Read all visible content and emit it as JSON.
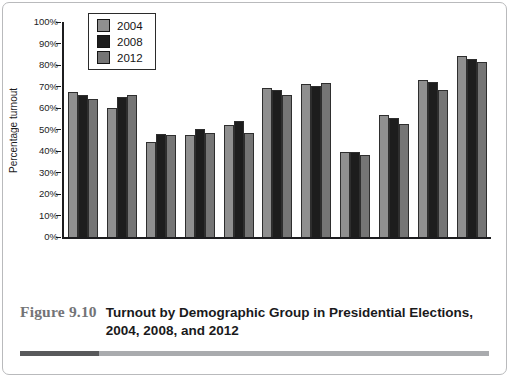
{
  "figure": {
    "label": "Figure 9.10",
    "title_line1": "Turnout by Demographic Group in Presidential Elections,",
    "title_line2": "2004, 2008, and 2012"
  },
  "chart_data": {
    "type": "bar",
    "title": "",
    "xlabel": "",
    "ylabel": "Percentage turnout",
    "ylim": [
      0,
      100
    ],
    "ytick_step": 10,
    "ytick_suffix": "%",
    "grid": false,
    "legend_position": "top-left",
    "bar_outline_color": "#2e2e2e",
    "categories": [
      "White (not Hispanic)",
      "African American",
      "Asian/Pacific",
      "Latino",
      "Under 35",
      "35–64",
      "65 and over",
      "Less than high school",
      "High school diploma",
      "College (some + BA)",
      "Postgraduate"
    ],
    "series": [
      {
        "name": "2004",
        "color": "#8f8f8f",
        "values": [
          67,
          60,
          44,
          47,
          52,
          69,
          71,
          39.5,
          56.5,
          73,
          84
        ]
      },
      {
        "name": "2008",
        "color": "#1d1d1d",
        "values": [
          66,
          65,
          47.5,
          50,
          53.5,
          68,
          70,
          39.5,
          55,
          72,
          82.5
        ]
      },
      {
        "name": "2012",
        "color": "#757575",
        "values": [
          64,
          66,
          47,
          48,
          48,
          66,
          71.5,
          38,
          52.5,
          68,
          81
        ]
      }
    ]
  }
}
